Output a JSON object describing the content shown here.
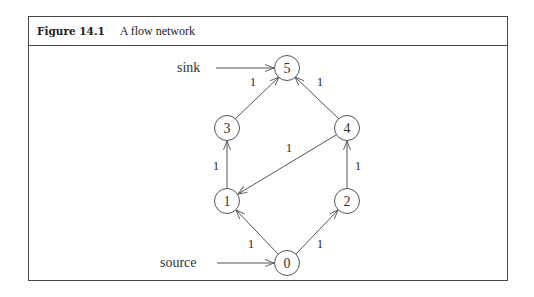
{
  "figure": {
    "number": "Figure 14.1",
    "title": "A flow network"
  },
  "graph": {
    "nodes": [
      {
        "id": "0",
        "label": "0",
        "x": 287,
        "y": 263
      },
      {
        "id": "1",
        "label": "1",
        "x": 227,
        "y": 201
      },
      {
        "id": "2",
        "label": "2",
        "x": 347,
        "y": 201
      },
      {
        "id": "3",
        "label": "3",
        "x": 227,
        "y": 128
      },
      {
        "id": "4",
        "label": "4",
        "x": 347,
        "y": 128
      },
      {
        "id": "5",
        "label": "5",
        "x": 287,
        "y": 68
      }
    ],
    "edges": [
      {
        "from": "0",
        "to": "1",
        "capacity": "1"
      },
      {
        "from": "0",
        "to": "2",
        "capacity": "1"
      },
      {
        "from": "1",
        "to": "3",
        "capacity": "1"
      },
      {
        "from": "2",
        "to": "4",
        "capacity": "1"
      },
      {
        "from": "4",
        "to": "1",
        "capacity": "1"
      },
      {
        "from": "3",
        "to": "5",
        "capacity": "1"
      },
      {
        "from": "4",
        "to": "5",
        "capacity": "1"
      }
    ],
    "terminals": {
      "source_label": "source",
      "sink_label": "sink"
    },
    "colors": {
      "stroke": "#555555",
      "text": "#333333"
    }
  }
}
